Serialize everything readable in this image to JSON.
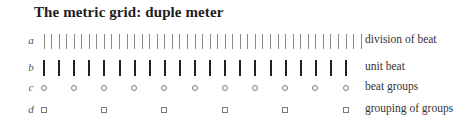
{
  "title": "The metric grid: duple meter",
  "rows": [
    {
      "letter": "a",
      "label": "division of beat"
    },
    {
      "letter": "b",
      "label": "unit beat"
    },
    {
      "letter": "c",
      "label": "beat groups"
    },
    {
      "letter": "d",
      "label": "grouping of groups"
    }
  ],
  "grid": {
    "division_ticks": 43,
    "unit_beats": 21,
    "beat_groups": 11,
    "grouping_of_groups": 6,
    "start_x": 44,
    "end_x": 350
  }
}
